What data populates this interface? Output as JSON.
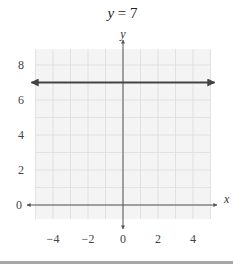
{
  "chart_data": {
    "type": "line",
    "title": "y = 7",
    "xlabel": "x",
    "ylabel": "y",
    "x_ticks": [
      -4,
      -2,
      0,
      2,
      4
    ],
    "y_ticks": [
      0,
      2,
      4,
      6,
      8
    ],
    "xlim": [
      -5,
      5
    ],
    "ylim": [
      -0.8,
      8.9
    ],
    "grid": true,
    "series": [
      {
        "name": "y = 7",
        "x": [
          -5,
          5
        ],
        "y": [
          7,
          7
        ],
        "arrows": "both",
        "color": "#444444"
      }
    ]
  },
  "title": {
    "var": "y",
    "rest": " = 7"
  },
  "axes": {
    "x_label": "x",
    "y_label": "y"
  },
  "colors": {
    "grid": "#dcdcdc",
    "grid_bg": "#f4f4f4",
    "axis": "#555555",
    "line": "#444444",
    "rule": "#a8a8a8"
  }
}
